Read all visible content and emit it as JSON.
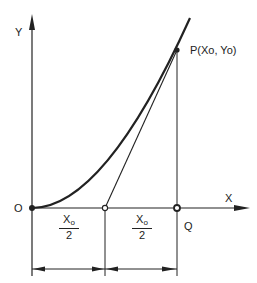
{
  "diagram": {
    "axes": {
      "y_label": "Y",
      "x_label": "X"
    },
    "points": {
      "origin_label": "O",
      "q_label": "Q",
      "p_label": "P(Xo, Yo)"
    },
    "dimensions": {
      "left_half": {
        "numerator": "X",
        "subscript": "o",
        "denominator": "2"
      },
      "right_half": {
        "numerator": "X",
        "subscript": "o",
        "denominator": "2"
      }
    },
    "colors": {
      "ink": "#222222",
      "background": "#ffffff"
    }
  }
}
